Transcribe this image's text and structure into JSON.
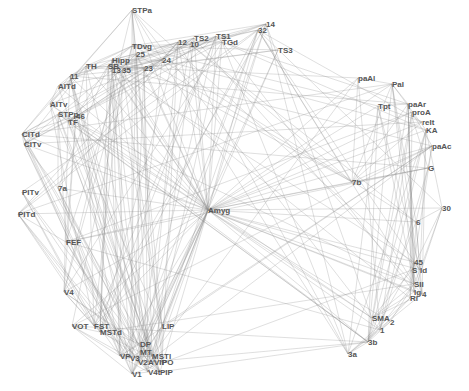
{
  "diagram": {
    "type": "network",
    "center_node": "Amyg",
    "edge_color": "#8a8a8a",
    "label_color": "#555555",
    "nodes": [
      {
        "id": "STPa",
        "x": 132,
        "y": 10
      },
      {
        "id": "TS2",
        "x": 194,
        "y": 38
      },
      {
        "id": "TS1",
        "x": 216,
        "y": 36
      },
      {
        "id": "TGd",
        "x": 222,
        "y": 42
      },
      {
        "id": "14",
        "x": 266,
        "y": 24
      },
      {
        "id": "32",
        "x": 258,
        "y": 30
      },
      {
        "id": "TS3",
        "x": 278,
        "y": 50
      },
      {
        "id": "TDvg",
        "x": 132,
        "y": 46
      },
      {
        "id": "12",
        "x": 178,
        "y": 42
      },
      {
        "id": "10",
        "x": 190,
        "y": 44
      },
      {
        "id": "25",
        "x": 136,
        "y": 54
      },
      {
        "id": "24",
        "x": 162,
        "y": 60
      },
      {
        "id": "Hipp",
        "x": 112,
        "y": 60
      },
      {
        "id": "TH",
        "x": 86,
        "y": 66
      },
      {
        "id": "SB",
        "x": 108,
        "y": 66
      },
      {
        "id": "13",
        "x": 112,
        "y": 70
      },
      {
        "id": "35",
        "x": 122,
        "y": 70
      },
      {
        "id": "23",
        "x": 144,
        "y": 68
      },
      {
        "id": "11",
        "x": 70,
        "y": 76
      },
      {
        "id": "AITd",
        "x": 58,
        "y": 86
      },
      {
        "id": "AITv",
        "x": 50,
        "y": 104
      },
      {
        "id": "STPp",
        "x": 58,
        "y": 114
      },
      {
        "id": "46",
        "x": 76,
        "y": 116
      },
      {
        "id": "TF",
        "x": 68,
        "y": 122
      },
      {
        "id": "CITd",
        "x": 22,
        "y": 134
      },
      {
        "id": "CITv",
        "x": 24,
        "y": 144
      },
      {
        "id": "PITv",
        "x": 22,
        "y": 192
      },
      {
        "id": "7a",
        "x": 58,
        "y": 188
      },
      {
        "id": "PITd",
        "x": 18,
        "y": 214
      },
      {
        "id": "FEF",
        "x": 66,
        "y": 242
      },
      {
        "id": "V4",
        "x": 64,
        "y": 292
      },
      {
        "id": "VOT",
        "x": 72,
        "y": 326
      },
      {
        "id": "FST",
        "x": 94,
        "y": 326
      },
      {
        "id": "MSTd",
        "x": 100,
        "y": 332
      },
      {
        "id": "LIP",
        "x": 162,
        "y": 326
      },
      {
        "id": "DP",
        "x": 140,
        "y": 344
      },
      {
        "id": "MT",
        "x": 140,
        "y": 352
      },
      {
        "id": "MSTl",
        "x": 152,
        "y": 356
      },
      {
        "id": "VP",
        "x": 120,
        "y": 356
      },
      {
        "id": "V3",
        "x": 130,
        "y": 358
      },
      {
        "id": "V2",
        "x": 138,
        "y": 362
      },
      {
        "id": "A",
        "x": 148,
        "y": 362
      },
      {
        "id": "VIP",
        "x": 154,
        "y": 362
      },
      {
        "id": "PO",
        "x": 162,
        "y": 362
      },
      {
        "id": "V1",
        "x": 132,
        "y": 374
      },
      {
        "id": "V4t",
        "x": 148,
        "y": 372
      },
      {
        "id": "PIP",
        "x": 160,
        "y": 372
      },
      {
        "id": "Amyg",
        "x": 208,
        "y": 210
      },
      {
        "id": "paAl",
        "x": 358,
        "y": 78
      },
      {
        "id": "PaI",
        "x": 392,
        "y": 84
      },
      {
        "id": "Tpt",
        "x": 378,
        "y": 106
      },
      {
        "id": "paAr",
        "x": 408,
        "y": 104
      },
      {
        "id": "proA",
        "x": 412,
        "y": 112
      },
      {
        "id": "reIt",
        "x": 422,
        "y": 122
      },
      {
        "id": "KA",
        "x": 426,
        "y": 130
      },
      {
        "id": "paAc",
        "x": 432,
        "y": 146
      },
      {
        "id": "G",
        "x": 428,
        "y": 168
      },
      {
        "id": "7b",
        "x": 352,
        "y": 182
      },
      {
        "id": "30",
        "x": 442,
        "y": 208
      },
      {
        "id": "6",
        "x": 416,
        "y": 222
      },
      {
        "id": "45",
        "x": 414,
        "y": 262
      },
      {
        "id": "S",
        "x": 412,
        "y": 270
      },
      {
        "id": "Id",
        "x": 420,
        "y": 270
      },
      {
        "id": "SII",
        "x": 414,
        "y": 284
      },
      {
        "id": "Ig",
        "x": 414,
        "y": 292
      },
      {
        "id": "4",
        "x": 422,
        "y": 294
      },
      {
        "id": "Ri",
        "x": 410,
        "y": 298
      },
      {
        "id": "SMA",
        "x": 372,
        "y": 318
      },
      {
        "id": "2",
        "x": 390,
        "y": 322
      },
      {
        "id": "1",
        "x": 380,
        "y": 330
      },
      {
        "id": "3b",
        "x": 368,
        "y": 342
      },
      {
        "id": "3a",
        "x": 348,
        "y": 354
      }
    ]
  }
}
